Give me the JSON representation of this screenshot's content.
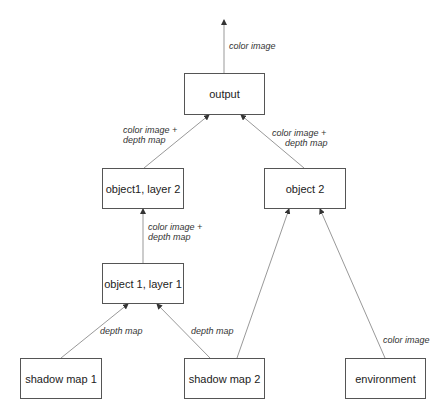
{
  "nodes": {
    "output": "output",
    "object1_layer2": "object1, layer 2",
    "object2": "object 2",
    "object1_layer1": "object 1, layer 1",
    "shadow_map_1": "shadow map 1",
    "shadow_map_2": "shadow map 2",
    "environment": "environment"
  },
  "edges": {
    "output_out": "color image",
    "l2_to_output_1": "color image +",
    "l2_to_output_2": "depth map",
    "obj2_to_output_1": "color image +",
    "obj2_to_output_2": "depth map",
    "l1_to_l2_1": "color image +",
    "l1_to_l2_2": "depth map",
    "sm1_to_l1": "depth map",
    "sm2_to_l1": "depth map",
    "env_to_obj2": "color image"
  }
}
